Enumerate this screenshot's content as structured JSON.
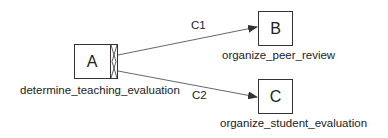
{
  "diagram": {
    "nodes": [
      {
        "id": "A",
        "letter": "A",
        "label": "determine_teaching_evaluation"
      },
      {
        "id": "B",
        "letter": "B",
        "label": "organize_peer_review"
      },
      {
        "id": "C",
        "letter": "C",
        "label": "organize_student_evaluation"
      }
    ],
    "edges": [
      {
        "from": "A",
        "to": "B",
        "label": "C1"
      },
      {
        "from": "A",
        "to": "C",
        "label": "C2"
      }
    ],
    "colors": {
      "stroke": "#333333",
      "text": "#222222",
      "background": "#ffffff"
    }
  }
}
